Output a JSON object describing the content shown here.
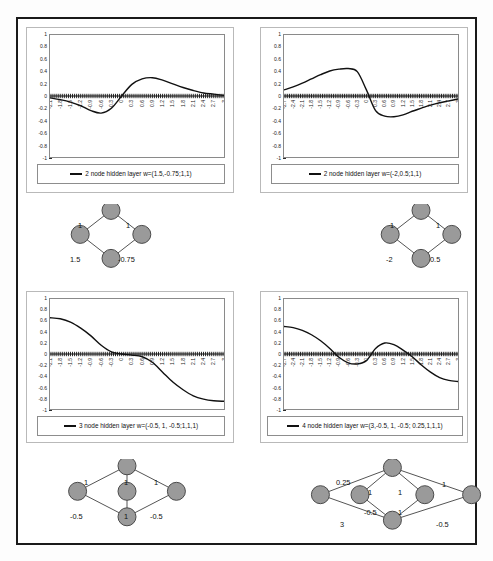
{
  "figure": {
    "border_color": "#1a1a1a",
    "background": "#ffffff"
  },
  "chart_data": [
    {
      "id": "chart-1",
      "type": "line",
      "title": "",
      "xlabel": "",
      "ylabel": "",
      "legend": "2 node hidden layer w=(1.5,-0.75;1,1)",
      "legend_position": "bottom",
      "grid": false,
      "xlim": [
        -2.1,
        3.0
      ],
      "ylim": [
        -1,
        1
      ],
      "yticks": [
        1,
        0.8,
        0.6,
        0.4,
        0.2,
        0,
        -0.2,
        -0.4,
        -0.6,
        -0.8,
        -1
      ],
      "ytick_labels": [
        "1",
        "0.8",
        "0.6",
        "0.4",
        "0.2",
        "0",
        "-0.2",
        "-0.4",
        "-0.6",
        "-0.8",
        "-1"
      ],
      "xticks": [
        -2.1,
        -1.8,
        -1.5,
        -1.2,
        -0.9,
        -0.6,
        -0.3,
        0,
        0.3,
        0.6,
        0.9,
        1.2,
        1.5,
        1.8,
        2.1,
        2.4,
        2.7,
        3
      ],
      "xtick_labels": [
        "-2.1",
        "-1.8",
        "-1.5",
        "-1.2",
        "-0.9",
        "-0.6",
        "-0.3",
        "0",
        "0.3",
        "0.6",
        "0.9",
        "1.2",
        "1.5",
        "1.8",
        "2.1",
        "2.4",
        "2.7",
        "3"
      ],
      "series": [
        {
          "name": "2 node hidden layer w=(1.5,-0.75;1,1)",
          "color": "#111111",
          "x": [
            -2.1,
            -1.8,
            -1.5,
            -1.2,
            -0.9,
            -0.6,
            -0.3,
            0,
            0.3,
            0.6,
            0.9,
            1.2,
            1.5,
            1.8,
            2.1,
            2.4,
            2.7,
            3
          ],
          "y": [
            -0.03,
            -0.06,
            -0.1,
            -0.16,
            -0.24,
            -0.28,
            -0.2,
            0.0,
            0.19,
            0.28,
            0.3,
            0.26,
            0.2,
            0.14,
            0.09,
            0.05,
            0.03,
            0.01
          ]
        }
      ]
    },
    {
      "id": "chart-2",
      "type": "line",
      "title": "",
      "xlabel": "",
      "ylabel": "",
      "legend": "2 node hidden layer w=(-2,0.5;1,1)",
      "legend_position": "bottom",
      "grid": false,
      "xlim": [
        -2.7,
        3.0
      ],
      "ylim": [
        -1,
        1
      ],
      "yticks": [
        1,
        0.8,
        0.6,
        0.4,
        0.2,
        0,
        -0.2,
        -0.4,
        -0.6,
        -0.8,
        -1
      ],
      "ytick_labels": [
        "1",
        "0.8",
        "0.6",
        "0.4",
        "0.2",
        "0",
        "-0.2",
        "-0.4",
        "-0.6",
        "-0.8",
        "-1"
      ],
      "xticks": [
        -2.7,
        -2.4,
        -2.1,
        -1.8,
        -1.5,
        -1.2,
        -0.9,
        -0.6,
        -0.3,
        0,
        0.3,
        0.6,
        0.9,
        1.2,
        1.5,
        1.8,
        2.1,
        2.4,
        2.7,
        3
      ],
      "xtick_labels": [
        "-2.7",
        "-2.4",
        "-2.1",
        "-1.8",
        "-1.5",
        "-1.2",
        "-0.9",
        "-0.6",
        "-0.3",
        "0",
        "0.3",
        "0.6",
        "0.9",
        "1.2",
        "1.5",
        "1.8",
        "2.1",
        "2.4",
        "2.7",
        "3"
      ],
      "series": [
        {
          "name": "2 node hidden layer w=(-2,0.5;1,1)",
          "color": "#111111",
          "x": [
            -2.7,
            -2.4,
            -2.1,
            -1.8,
            -1.5,
            -1.2,
            -0.9,
            -0.6,
            -0.3,
            0,
            0.3,
            0.6,
            0.9,
            1.2,
            1.5,
            1.8,
            2.1,
            2.4,
            2.7,
            3
          ],
          "y": [
            0.1,
            0.15,
            0.21,
            0.28,
            0.35,
            0.41,
            0.44,
            0.45,
            0.4,
            0.1,
            -0.24,
            -0.33,
            -0.34,
            -0.31,
            -0.25,
            -0.2,
            -0.15,
            -0.11,
            -0.08,
            -0.05
          ]
        }
      ]
    },
    {
      "id": "chart-3",
      "type": "line",
      "title": "",
      "xlabel": "",
      "ylabel": "",
      "legend": "3 node hidden layer w=(-0.5, 1, -0.5;1,1,1)",
      "legend_position": "bottom",
      "grid": false,
      "xlim": [
        -2.1,
        3.0
      ],
      "ylim": [
        -1,
        1
      ],
      "yticks": [
        1,
        0.8,
        0.6,
        0.4,
        0.2,
        0,
        -0.2,
        -0.4,
        -0.6,
        -0.8,
        -1
      ],
      "ytick_labels": [
        "1",
        "0.8",
        "0.6",
        "0.4",
        "0.2",
        "0",
        "-0.2",
        "-0.4",
        "-0.6",
        "-0.8",
        "-1"
      ],
      "xticks": [
        -2.1,
        -1.8,
        -1.5,
        -1.2,
        -0.9,
        -0.6,
        -0.3,
        0,
        0.3,
        0.6,
        0.9,
        1.2,
        1.5,
        1.8,
        2.1,
        2.4,
        2.7,
        3
      ],
      "xtick_labels": [
        "-2.1",
        "-1.8",
        "-1.5",
        "-1.2",
        "-0.9",
        "-0.6",
        "-0.3",
        "0",
        "0.3",
        "0.6",
        "0.9",
        "1.2",
        "1.5",
        "1.8",
        "2.1",
        "2.4",
        "2.7",
        "3"
      ],
      "series": [
        {
          "name": "3 node hidden layer w=(-0.5, 1, -0.5;1,1,1)",
          "color": "#111111",
          "x": [
            -2.1,
            -1.8,
            -1.5,
            -1.2,
            -0.9,
            -0.6,
            -0.3,
            0,
            0.3,
            0.6,
            0.9,
            1.2,
            1.5,
            1.8,
            2.1,
            2.4,
            2.7,
            3
          ],
          "y": [
            0.66,
            0.64,
            0.58,
            0.47,
            0.33,
            0.16,
            0.04,
            0.0,
            -0.02,
            -0.05,
            -0.15,
            -0.33,
            -0.51,
            -0.65,
            -0.76,
            -0.82,
            -0.85,
            -0.86
          ]
        }
      ]
    },
    {
      "id": "chart-4",
      "type": "line",
      "title": "",
      "xlabel": "",
      "ylabel": "",
      "legend": "4 node hidden layer w=(3,-0.5, 1, -0.5; 0.25,1,1,1)",
      "legend_position": "bottom",
      "grid": false,
      "xlim": [
        -2.7,
        3.0
      ],
      "ylim": [
        -1,
        1
      ],
      "yticks": [
        1,
        0.8,
        0.6,
        0.4,
        0.2,
        0,
        -0.2,
        -0.4,
        -0.6,
        -0.8,
        -1
      ],
      "ytick_labels": [
        "1",
        "0.8",
        "0.6",
        "0.4",
        "0.2",
        "0",
        "-0.2",
        "-0.4",
        "-0.6",
        "-0.8",
        "-1"
      ],
      "xticks": [
        -2.7,
        -2.4,
        -2.1,
        -1.8,
        -1.5,
        -1.2,
        -0.9,
        -0.6,
        -0.3,
        0,
        0.3,
        0.6,
        0.9,
        1.2,
        1.5,
        1.8,
        2.1,
        2.4,
        2.7,
        3
      ],
      "xtick_labels": [
        "-2.7",
        "-2.4",
        "-2.1",
        "-1.8",
        "-1.5",
        "-1.2",
        "-0.9",
        "-0.6",
        "-0.3",
        "0",
        "0.3",
        "0.6",
        "0.9",
        "1.2",
        "1.5",
        "1.8",
        "2.1",
        "2.4",
        "2.7",
        "3"
      ],
      "series": [
        {
          "name": "4 node hidden layer w=(3,-0.5, 1, -0.5; 0.25,1,1,1)",
          "color": "#111111",
          "x": [
            -2.7,
            -2.4,
            -2.1,
            -1.8,
            -1.5,
            -1.2,
            -0.9,
            -0.6,
            -0.3,
            0,
            0.3,
            0.6,
            0.9,
            1.2,
            1.5,
            1.8,
            2.1,
            2.4,
            2.7,
            3
          ],
          "y": [
            0.5,
            0.48,
            0.43,
            0.35,
            0.24,
            0.1,
            -0.06,
            -0.16,
            -0.18,
            -0.12,
            0.1,
            0.2,
            0.17,
            0.07,
            -0.05,
            -0.2,
            -0.33,
            -0.43,
            -0.48,
            -0.5
          ]
        }
      ]
    }
  ],
  "diagrams": [
    {
      "id": "diagram-1",
      "caption": "2 node hidden layer network",
      "node_fill": "#9a9a9a",
      "node_stroke": "#4a4a4a",
      "edge_color": "#555555",
      "nodes": [
        {
          "name": "output-node",
          "cx": 50,
          "cy": 8
        },
        {
          "name": "hidden-node-left",
          "cx": 22,
          "cy": 38
        },
        {
          "name": "hidden-node-right",
          "cx": 78,
          "cy": 38
        },
        {
          "name": "input-node",
          "cx": 50,
          "cy": 68
        }
      ],
      "weights": [
        {
          "name": "weight-top-left",
          "text": "1"
        },
        {
          "name": "weight-top-right",
          "text": "1"
        },
        {
          "name": "weight-bottom-left",
          "text": "1.5"
        },
        {
          "name": "weight-bottom-right",
          "text": "-0.75"
        }
      ]
    },
    {
      "id": "diagram-2",
      "caption": "2 node hidden layer network",
      "node_fill": "#9a9a9a",
      "node_stroke": "#4a4a4a",
      "edge_color": "#555555",
      "nodes": [
        {
          "name": "output-node",
          "cx": 50,
          "cy": 8
        },
        {
          "name": "hidden-node-left",
          "cx": 22,
          "cy": 38
        },
        {
          "name": "hidden-node-right",
          "cx": 78,
          "cy": 38
        },
        {
          "name": "input-node",
          "cx": 50,
          "cy": 68
        }
      ],
      "weights": [
        {
          "name": "weight-top-left",
          "text": "1"
        },
        {
          "name": "weight-top-right",
          "text": "1"
        },
        {
          "name": "weight-bottom-left",
          "text": "-2"
        },
        {
          "name": "weight-bottom-right",
          "text": "0.5"
        }
      ]
    },
    {
      "id": "diagram-3",
      "caption": "3 node hidden layer network",
      "node_fill": "#9a9a9a",
      "node_stroke": "#4a4a4a",
      "edge_color": "#555555",
      "nodes": [
        {
          "name": "output-node",
          "cx": 50,
          "cy": 8
        },
        {
          "name": "hidden-node-left",
          "cx": 12,
          "cy": 38
        },
        {
          "name": "hidden-node-center",
          "cx": 50,
          "cy": 38
        },
        {
          "name": "hidden-node-right",
          "cx": 88,
          "cy": 38
        },
        {
          "name": "input-node",
          "cx": 50,
          "cy": 68
        }
      ],
      "weights": [
        {
          "name": "weight-top-left",
          "text": "1"
        },
        {
          "name": "weight-top-center",
          "text": "1"
        },
        {
          "name": "weight-top-right",
          "text": "1"
        },
        {
          "name": "weight-bottom-left",
          "text": "-0.5"
        },
        {
          "name": "weight-bottom-center",
          "text": "1"
        },
        {
          "name": "weight-bottom-right",
          "text": "-0.5"
        }
      ]
    },
    {
      "id": "diagram-4",
      "caption": "4 node hidden layer network",
      "node_fill": "#9a9a9a",
      "node_stroke": "#4a4a4a",
      "edge_color": "#555555",
      "nodes": [
        {
          "name": "output-node",
          "cx": 8,
          "cy": 42
        },
        {
          "name": "hidden-node-upper",
          "cx": 48,
          "cy": 10
        },
        {
          "name": "hidden-node-left",
          "cx": 30,
          "cy": 42
        },
        {
          "name": "hidden-node-right",
          "cx": 66,
          "cy": 42
        },
        {
          "name": "hidden-node-lower",
          "cx": 48,
          "cy": 72
        },
        {
          "name": "input-node",
          "cx": 92,
          "cy": 42
        }
      ],
      "weights": [
        {
          "name": "weight-output-upper",
          "text": "0.25"
        },
        {
          "name": "weight-output-lower",
          "text": "3"
        },
        {
          "name": "weight-upper-left",
          "text": "1"
        },
        {
          "name": "weight-upper-right",
          "text": "1"
        },
        {
          "name": "weight-left-lower",
          "text": "-0.5"
        },
        {
          "name": "weight-lower-right",
          "text": "1"
        },
        {
          "name": "weight-input-upper",
          "text": "1"
        },
        {
          "name": "weight-input-lower",
          "text": "-0.5"
        }
      ]
    }
  ]
}
